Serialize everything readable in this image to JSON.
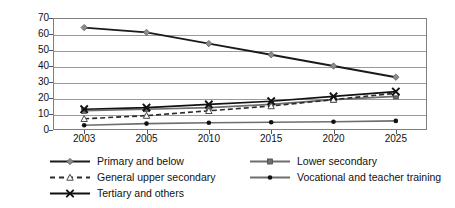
{
  "chart_data": {
    "type": "line",
    "title": "",
    "subtitle": "",
    "xlabel": "",
    "ylabel": "",
    "categories": [
      "2003",
      "2005",
      "2010",
      "2015",
      "2020",
      "2025"
    ],
    "ylim": [
      0,
      70
    ],
    "ytick_step": 10,
    "yticks": [
      "0",
      "10",
      "20",
      "30",
      "40",
      "50",
      "60",
      "70"
    ],
    "grid": true,
    "legend_position": "bottom",
    "series": [
      {
        "name": "Primary and below",
        "values": [
          64,
          61,
          54,
          47,
          40,
          33
        ],
        "marker": "diamond",
        "line_style": "solid",
        "color": "#1a1a1a",
        "marker_color": "#8c8c8c"
      },
      {
        "name": "Lower secondary",
        "values": [
          12,
          13,
          14,
          16,
          19,
          21
        ],
        "marker": "square",
        "line_style": "solid",
        "color": "#6e6e6e",
        "marker_color": "#6e6e6e"
      },
      {
        "name": "General upper secondary",
        "values": [
          7,
          9,
          12,
          15,
          19,
          23
        ],
        "marker": "triangle",
        "line_style": "dashed",
        "color": "#2b2b2b",
        "marker_color": "#9a9a9a"
      },
      {
        "name": "Vocational and teacher training",
        "values": [
          3,
          4,
          4.5,
          4.8,
          5.2,
          5.7
        ],
        "marker": "dot",
        "line_style": "solid",
        "color": "#6e6e6e",
        "marker_color": "#111111"
      },
      {
        "name": "Tertiary and others",
        "values": [
          13,
          14,
          16,
          18,
          21,
          24
        ],
        "marker": "cross",
        "line_style": "solid",
        "color": "#111111",
        "marker_color": "#111111"
      }
    ]
  },
  "legend": {
    "items": [
      {
        "label": "Primary and below"
      },
      {
        "label": "Lower secondary"
      },
      {
        "label": "General upper secondary"
      },
      {
        "label": "Vocational and teacher training"
      },
      {
        "label": "Tertiary and others"
      }
    ]
  }
}
